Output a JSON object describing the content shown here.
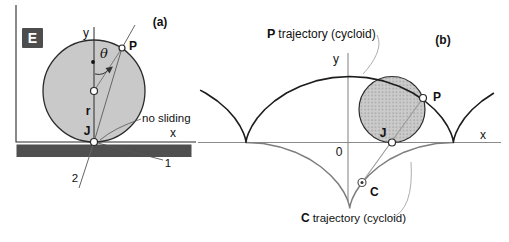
{
  "figure": {
    "panel_a": {
      "badge": "E",
      "caption": "(a)",
      "axis": {
        "y_label": "y",
        "x_label": "x"
      },
      "labels": {
        "theta": "θ",
        "radius": "r",
        "contact_point": "J",
        "rim_point": "P",
        "no_sliding": "no sliding",
        "line1": "1",
        "line2": "2"
      }
    },
    "panel_b": {
      "caption": "(b)",
      "axis": {
        "y_label": "y",
        "x_label": "x",
        "origin": "0"
      },
      "labels": {
        "contact_point": "J",
        "rim_point": "P",
        "curvature_center": "C"
      },
      "p_trajectory": {
        "point": "P",
        "text": "trajectory (cycloid)"
      },
      "c_trajectory": {
        "point": "C",
        "text": "trajectory (cycloid)"
      }
    },
    "colors": {
      "wheel_fill": "#c9c9c9",
      "stipple_base": "#cbcbcb",
      "stipple_dot": "#a6a6a6",
      "ground": "#4f4f4f",
      "badge_bg": "#4d4d4d",
      "curve_black": "#1c1c1c",
      "curve_gray": "#7d7d7d",
      "axis_gray": "#8a8a8a",
      "leader_gray": "#adadad"
    }
  }
}
